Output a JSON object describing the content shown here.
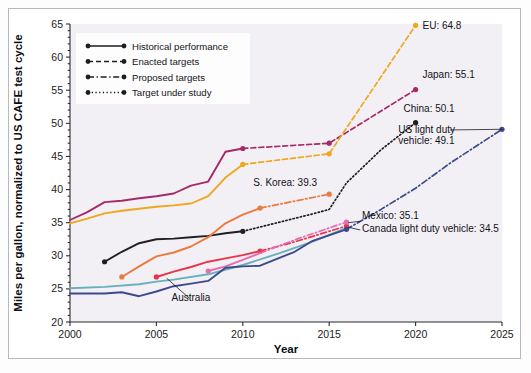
{
  "chart_data": {
    "type": "line",
    "title": "",
    "xlabel": "Year",
    "ylabel": "Miles per gallon, normalized to US CAFE test cycle",
    "xlim": [
      2000,
      2025
    ],
    "ylim": [
      20,
      65
    ],
    "xticks": [
      2000,
      2005,
      2010,
      2015,
      2020,
      2025
    ],
    "yticks": [
      20,
      25,
      30,
      35,
      40,
      45,
      50,
      55,
      60,
      65
    ],
    "grid": false,
    "legend_position": "upper-left",
    "legend": [
      {
        "label": "Historical performance",
        "style": "solid"
      },
      {
        "label": "Enacted targets",
        "style": "dashed"
      },
      {
        "label": "Proposed targets",
        "style": "dashdot"
      },
      {
        "label": "Target under study",
        "style": "dotted"
      }
    ],
    "series": [
      {
        "name": "Japan",
        "color": "#a52a68",
        "segments": [
          {
            "style": "solid",
            "points": [
              [
                2000,
                35.4
              ],
              [
                2001,
                36.6
              ],
              [
                2002,
                38.1
              ],
              [
                2003,
                38.3
              ],
              [
                2004,
                38.7
              ],
              [
                2005,
                39.0
              ],
              [
                2006,
                39.4
              ],
              [
                2007,
                40.6
              ],
              [
                2008,
                41.2
              ],
              [
                2009,
                45.7
              ],
              [
                2010,
                46.2
              ]
            ]
          },
          {
            "style": "dashed",
            "points": [
              [
                2010,
                46.2
              ],
              [
                2015,
                47.0
              ],
              [
                2020,
                55.1
              ]
            ]
          }
        ],
        "markers": [
          [
            2010,
            46.2
          ],
          [
            2015,
            47.0
          ],
          [
            2020,
            55.1
          ]
        ],
        "label": {
          "text": "Japan: 55.1",
          "x": 2020.4,
          "y": 56.8
        }
      },
      {
        "name": "EU",
        "color": "#efa81c",
        "segments": [
          {
            "style": "solid",
            "points": [
              [
                2000,
                34.9
              ],
              [
                2001,
                35.6
              ],
              [
                2002,
                36.4
              ],
              [
                2003,
                36.8
              ],
              [
                2004,
                37.1
              ],
              [
                2005,
                37.4
              ],
              [
                2006,
                37.6
              ],
              [
                2007,
                37.9
              ],
              [
                2008,
                39.0
              ],
              [
                2009,
                41.8
              ],
              [
                2010,
                43.8
              ]
            ]
          },
          {
            "style": "dashed",
            "points": [
              [
                2010,
                43.8
              ],
              [
                2015,
                45.4
              ],
              [
                2020,
                64.8
              ]
            ]
          }
        ],
        "markers": [
          [
            2010,
            43.8
          ],
          [
            2015,
            45.4
          ],
          [
            2020,
            64.8
          ]
        ],
        "label": {
          "text": "EU: 64.8",
          "x": 2020.4,
          "y": 64.2
        }
      },
      {
        "name": "China",
        "color": "#231f20",
        "segments": [
          {
            "style": "solid",
            "points": [
              [
                2002,
                29.1
              ],
              [
                2003,
                30.6
              ],
              [
                2004,
                31.9
              ],
              [
                2005,
                32.5
              ],
              [
                2006,
                32.6
              ],
              [
                2007,
                32.8
              ],
              [
                2008,
                33.0
              ],
              [
                2009,
                33.4
              ],
              [
                2010,
                33.7
              ]
            ]
          },
          {
            "style": "dotted",
            "points": [
              [
                2010,
                33.7
              ],
              [
                2012,
                35.0
              ],
              [
                2014,
                36.3
              ],
              [
                2015,
                37.0
              ],
              [
                2016,
                41.0
              ],
              [
                2018,
                46.0
              ],
              [
                2020,
                50.1
              ]
            ]
          }
        ],
        "markers": [
          [
            2002,
            29.1
          ],
          [
            2010,
            33.7
          ],
          [
            2020,
            50.1
          ]
        ],
        "label": {
          "text": "China: 50.1",
          "x": 2019.3,
          "y": 51.7
        }
      },
      {
        "name": "S. Korea",
        "color": "#ea7b3c",
        "segments": [
          {
            "style": "solid",
            "points": [
              [
                2003,
                26.8
              ],
              [
                2004,
                28.4
              ],
              [
                2005,
                29.9
              ],
              [
                2006,
                30.5
              ],
              [
                2007,
                31.4
              ],
              [
                2008,
                32.8
              ],
              [
                2009,
                34.9
              ],
              [
                2010,
                36.2
              ],
              [
                2011,
                37.2
              ]
            ]
          },
          {
            "style": "dashdot",
            "points": [
              [
                2011,
                37.2
              ],
              [
                2015,
                39.3
              ]
            ]
          }
        ],
        "markers": [
          [
            2003,
            26.8
          ],
          [
            2011,
            37.2
          ],
          [
            2015,
            39.3
          ]
        ],
        "label": {
          "text": "S. Korea: 39.3",
          "x": 2010.6,
          "y": 40.6
        }
      },
      {
        "name": "Canada light duty vehicle",
        "color": "#e8334a",
        "segments": [
          {
            "style": "solid",
            "points": [
              [
                2005,
                26.8
              ],
              [
                2006,
                27.6
              ],
              [
                2007,
                28.3
              ],
              [
                2008,
                29.1
              ],
              [
                2009,
                29.6
              ],
              [
                2010,
                30.1
              ],
              [
                2011,
                30.7
              ]
            ]
          },
          {
            "style": "dashdot",
            "points": [
              [
                2011,
                30.7
              ],
              [
                2013,
                32.1
              ],
              [
                2016,
                34.5
              ]
            ]
          }
        ],
        "markers": [
          [
            2005,
            26.8
          ],
          [
            2011,
            30.7
          ],
          [
            2016,
            34.5
          ]
        ],
        "label": {
          "text": "Canada light duty vehicle: 34.5",
          "x": 2016.9,
          "y": 33.6
        }
      },
      {
        "name": "Mexico",
        "color": "#e86bb0",
        "segments": [
          {
            "style": "solid",
            "points": [
              [
                2008,
                27.7
              ],
              [
                2009,
                28.4
              ],
              [
                2010,
                29.4
              ],
              [
                2011,
                30.4
              ]
            ]
          },
          {
            "style": "dashdot",
            "points": [
              [
                2011,
                30.4
              ],
              [
                2013,
                32.4
              ],
              [
                2016,
                35.1
              ]
            ]
          }
        ],
        "markers": [
          [
            2008,
            27.7
          ],
          [
            2016,
            35.1
          ]
        ],
        "label": {
          "text": "Mexico: 35.1",
          "x": 2016.9,
          "y": 35.5
        }
      },
      {
        "name": "Australia",
        "color": "#67b0bc",
        "segments": [
          {
            "style": "solid",
            "points": [
              [
                2000,
                25.1
              ],
              [
                2002,
                25.3
              ],
              [
                2004,
                25.7
              ],
              [
                2005,
                26.1
              ],
              [
                2006,
                26.4
              ],
              [
                2008,
                27.2
              ],
              [
                2010,
                28.6
              ],
              [
                2012,
                30.3
              ],
              [
                2014,
                32.1
              ],
              [
                2016,
                34.2
              ]
            ]
          }
        ],
        "markers": [],
        "label": {
          "text": "Australia",
          "x": 2007.0,
          "y": 23.1
        }
      },
      {
        "name": "US light duty vehicle",
        "color": "#3c4a8c",
        "segments": [
          {
            "style": "solid",
            "points": [
              [
                2000,
                24.3
              ],
              [
                2002,
                24.3
              ],
              [
                2003,
                24.5
              ],
              [
                2004,
                23.9
              ],
              [
                2005,
                24.6
              ],
              [
                2006,
                25.4
              ],
              [
                2007,
                25.8
              ],
              [
                2008,
                26.2
              ],
              [
                2009,
                28.2
              ],
              [
                2010,
                28.4
              ],
              [
                2011,
                28.5
              ],
              [
                2013,
                30.6
              ],
              [
                2014,
                32.2
              ],
              [
                2016,
                34.0
              ]
            ]
          },
          {
            "style": "dashdot",
            "points": [
              [
                2016,
                34.0
              ],
              [
                2018,
                37.0
              ],
              [
                2020,
                40.2
              ],
              [
                2022,
                44.0
              ],
              [
                2025,
                49.1
              ]
            ]
          }
        ],
        "markers": [
          [
            2016,
            34.0
          ],
          [
            2025,
            49.1
          ]
        ],
        "label": {
          "text": "US light duty vehicle: 49.1",
          "x": 2019.0,
          "y": 48.6
        }
      }
    ],
    "annotations": [
      {
        "name": "australia-leader",
        "from": [
          2006.9,
          23.6
        ],
        "to": [
          2005.6,
          26.6
        ]
      },
      {
        "name": "us-label-leader",
        "from": [
          2022.0,
          49.0
        ],
        "to": [
          2025.0,
          49.1
        ]
      },
      {
        "name": "mexico-leader",
        "from": [
          2016.8,
          35.2
        ],
        "to": [
          2016.1,
          35.0
        ]
      },
      {
        "name": "canada-leader",
        "from": [
          2016.8,
          33.9
        ],
        "to": [
          2016.1,
          34.3
        ]
      }
    ]
  }
}
